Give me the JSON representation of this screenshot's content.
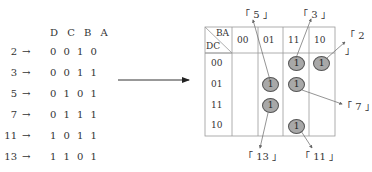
{
  "truth_table": {
    "header": "D C B A",
    "rows": [
      {
        "minterm": "2",
        "arrow": "→",
        "bits": "0 0 1 0"
      },
      {
        "minterm": "3",
        "arrow": "→",
        "bits": "0 0 1 1"
      },
      {
        "minterm": "5",
        "arrow": "→",
        "bits": "0 1 0 1"
      },
      {
        "minterm": "7",
        "arrow": "→",
        "bits": "0 1 1 1"
      },
      {
        "minterm": "11",
        "arrow": "→",
        "bits": "1 0 1 1"
      },
      {
        "minterm": "13",
        "arrow": "→",
        "bits": "1 1 0 1"
      }
    ]
  },
  "kmap": {
    "corner_top": "BA",
    "corner_bottom": "DC",
    "col_headers": [
      "00",
      "01",
      "11",
      "10"
    ],
    "row_headers": [
      "00",
      "01",
      "11",
      "10"
    ],
    "ones": [
      {
        "row": 0,
        "col": 2,
        "value": "1"
      },
      {
        "row": 0,
        "col": 3,
        "value": "1"
      },
      {
        "row": 1,
        "col": 1,
        "value": "1"
      },
      {
        "row": 1,
        "col": 2,
        "value": "1"
      },
      {
        "row": 2,
        "col": 1,
        "value": "1"
      },
      {
        "row": 3,
        "col": 2,
        "value": "1"
      }
    ],
    "callouts": [
      "「 5 」",
      "「 3 」",
      "「 2 」",
      "「 7 」",
      "「 13 」",
      "「 11 」"
    ]
  }
}
